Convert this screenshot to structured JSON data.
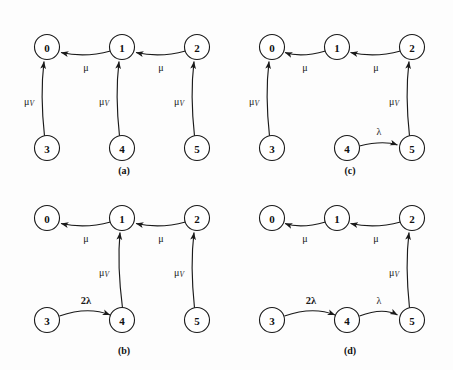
{
  "figure": {
    "title": "",
    "background_color": "#fdfdfd",
    "stroke_color": "#1a1a1a",
    "node_fill": "#ffffff",
    "width": 453,
    "height": 370
  },
  "labels": {
    "mu": "μ",
    "mu_v_base": "μ",
    "mu_v_sub": "V",
    "lambda": "λ",
    "two_lambda": "2λ"
  },
  "panels": [
    {
      "id": "a",
      "caption": "(a)",
      "nodes": [
        {
          "id": "n0",
          "label": "0"
        },
        {
          "id": "n1",
          "label": "1"
        },
        {
          "id": "n2",
          "label": "2"
        },
        {
          "id": "n3",
          "label": "3"
        },
        {
          "id": "n4",
          "label": "4"
        },
        {
          "id": "n5",
          "label": "5"
        }
      ],
      "edges": [
        {
          "from": "1",
          "to": "0",
          "label": "μ"
        },
        {
          "from": "2",
          "to": "1",
          "label": "μ"
        },
        {
          "from": "3",
          "to": "0",
          "label": "μV"
        },
        {
          "from": "4",
          "to": "1",
          "label": "μV"
        },
        {
          "from": "5",
          "to": "2",
          "label": "μV"
        }
      ]
    },
    {
      "id": "b",
      "caption": "(b)",
      "nodes": [
        {
          "id": "n0",
          "label": "0"
        },
        {
          "id": "n1",
          "label": "1"
        },
        {
          "id": "n2",
          "label": "2"
        },
        {
          "id": "n3",
          "label": "3"
        },
        {
          "id": "n4",
          "label": "4"
        },
        {
          "id": "n5",
          "label": "5"
        }
      ],
      "edges": [
        {
          "from": "1",
          "to": "0",
          "label": "μ"
        },
        {
          "from": "2",
          "to": "1",
          "label": "μ"
        },
        {
          "from": "4",
          "to": "1",
          "label": "μV"
        },
        {
          "from": "5",
          "to": "2",
          "label": "μV"
        },
        {
          "from": "3",
          "to": "4",
          "label": "2λ"
        }
      ]
    },
    {
      "id": "c",
      "caption": "(c)",
      "nodes": [
        {
          "id": "n0",
          "label": "0"
        },
        {
          "id": "n1",
          "label": "1"
        },
        {
          "id": "n2",
          "label": "2"
        },
        {
          "id": "n3",
          "label": "3"
        },
        {
          "id": "n4",
          "label": "4"
        },
        {
          "id": "n5",
          "label": "5"
        }
      ],
      "edges": [
        {
          "from": "1",
          "to": "0",
          "label": "μ"
        },
        {
          "from": "2",
          "to": "1",
          "label": "μ"
        },
        {
          "from": "3",
          "to": "0",
          "label": "μV"
        },
        {
          "from": "5",
          "to": "2",
          "label": "μV"
        },
        {
          "from": "4",
          "to": "5",
          "label": "λ"
        }
      ]
    },
    {
      "id": "d",
      "caption": "(d)",
      "nodes": [
        {
          "id": "n0",
          "label": "0"
        },
        {
          "id": "n1",
          "label": "1"
        },
        {
          "id": "n2",
          "label": "2"
        },
        {
          "id": "n3",
          "label": "3"
        },
        {
          "id": "n4",
          "label": "4"
        },
        {
          "id": "n5",
          "label": "5"
        }
      ],
      "edges": [
        {
          "from": "1",
          "to": "0",
          "label": "μ"
        },
        {
          "from": "2",
          "to": "1",
          "label": "μ"
        },
        {
          "from": "5",
          "to": "2",
          "label": "μV"
        },
        {
          "from": "3",
          "to": "4",
          "label": "2λ"
        },
        {
          "from": "4",
          "to": "5",
          "label": "λ"
        }
      ]
    }
  ]
}
